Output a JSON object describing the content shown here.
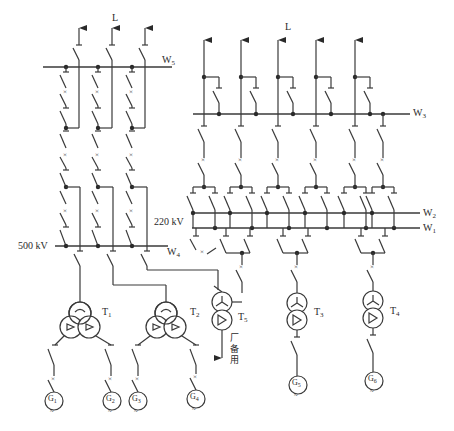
{
  "diagram": {
    "type": "electrical-single-line-diagram",
    "labels": {
      "line_left": "L",
      "line_right": "L",
      "bus_w5": {
        "base": "W",
        "sub": "5"
      },
      "bus_w3": {
        "base": "W",
        "sub": "3"
      },
      "bus_w2": {
        "base": "W",
        "sub": "2"
      },
      "bus_w1": {
        "base": "W",
        "sub": "1"
      },
      "bus_w4": {
        "base": "W",
        "sub": "4"
      },
      "voltage_500": "500 kV",
      "voltage_220": "220 kV",
      "aux_supply": [
        "厂",
        "备",
        "用"
      ]
    },
    "transformers": [
      {
        "id": "T1",
        "base": "T",
        "sub": "1",
        "type": "three-winding"
      },
      {
        "id": "T2",
        "base": "T",
        "sub": "2",
        "type": "three-winding"
      },
      {
        "id": "T5",
        "base": "T",
        "sub": "5",
        "type": "two-winding"
      },
      {
        "id": "T3",
        "base": "T",
        "sub": "3",
        "type": "two-winding"
      },
      {
        "id": "T4",
        "base": "T",
        "sub": "4",
        "type": "two-winding"
      }
    ],
    "generators": [
      {
        "id": "G1",
        "base": "G",
        "sub": "1"
      },
      {
        "id": "G2",
        "base": "G",
        "sub": "2"
      },
      {
        "id": "G3",
        "base": "G",
        "sub": "3"
      },
      {
        "id": "G4",
        "base": "G",
        "sub": "4"
      },
      {
        "id": "G5",
        "base": "G",
        "sub": "5"
      },
      {
        "id": "G6",
        "base": "G",
        "sub": "6"
      }
    ],
    "colors": {
      "line": "#3a3a3a",
      "background": "#ffffff"
    }
  }
}
